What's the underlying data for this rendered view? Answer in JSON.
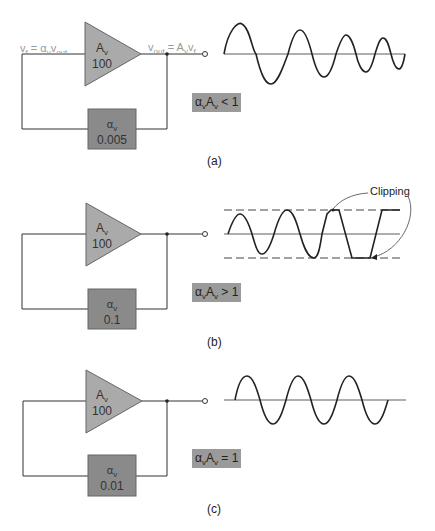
{
  "panels": [
    {
      "id": "a",
      "caption": "(a)",
      "amplifier": {
        "symbol": "A",
        "sub": "v",
        "gain": "100"
      },
      "feedback": {
        "symbol": "α",
        "sub": "v",
        "value": "0.005"
      },
      "input_eq": {
        "lhs": "v",
        "lhs_sub": "f",
        "eq": " = ",
        "rhs": "α",
        "rhs_sub": "v",
        "rhs2": "v",
        "rhs2_sub": "out"
      },
      "output_eq": {
        "lhs": "v",
        "lhs_sub": "out",
        "eq": " = ",
        "rhs": "A",
        "rhs_sub": "v",
        "rhs2": "v",
        "rhs2_sub": "f"
      },
      "loop_gain": {
        "a": "α",
        "a_sub": "v",
        "b": "A",
        "b_sub": "v",
        "rel": " < 1"
      },
      "waveform": "decaying"
    },
    {
      "id": "b",
      "caption": "(b)",
      "amplifier": {
        "symbol": "A",
        "sub": "v",
        "gain": "100"
      },
      "feedback": {
        "symbol": "α",
        "sub": "v",
        "value": "0.1"
      },
      "loop_gain": {
        "a": "α",
        "a_sub": "v",
        "b": "A",
        "b_sub": "v",
        "rel": " > 1"
      },
      "waveform": "growing-clipped",
      "annotation": "Clipping"
    },
    {
      "id": "c",
      "caption": "(c)",
      "amplifier": {
        "symbol": "A",
        "sub": "v",
        "gain": "100"
      },
      "feedback": {
        "symbol": "α",
        "sub": "v",
        "value": "0.01"
      },
      "loop_gain": {
        "a": "α",
        "a_sub": "v",
        "b": "A",
        "b_sub": "v",
        "rel": " = 1"
      },
      "waveform": "sustained"
    }
  ],
  "colors": {
    "amplifier": "#aaaaaa",
    "feedback": "#8a8a8a",
    "label_bg": "#9a9a9a",
    "wire": "#333333"
  }
}
